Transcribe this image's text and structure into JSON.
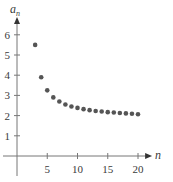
{
  "chart_data": {
    "type": "scatter",
    "title": "",
    "xlabel": "n",
    "ylabel": "a_n",
    "ylabel_display": "a",
    "ylabel_sub": "n",
    "x": [
      3,
      4,
      5,
      6,
      7,
      8,
      9,
      10,
      11,
      12,
      13,
      14,
      15,
      16,
      17,
      18,
      19,
      20
    ],
    "values": [
      5.5,
      3.9,
      3.25,
      2.9,
      2.7,
      2.55,
      2.45,
      2.38,
      2.32,
      2.27,
      2.23,
      2.2,
      2.17,
      2.15,
      2.13,
      2.11,
      2.09,
      2.07
    ],
    "xticks": [
      5,
      10,
      15,
      20
    ],
    "xtick_labels": [
      "5",
      "10",
      "15",
      "20"
    ],
    "yticks": [
      1,
      2,
      3,
      4,
      5,
      6
    ],
    "ytick_labels": [
      "1",
      "2",
      "3",
      "4",
      "5",
      "6"
    ],
    "xlim": [
      0,
      22
    ],
    "ylim": [
      0,
      7
    ],
    "grid": false,
    "legend": null,
    "colors": {
      "points": "#555555",
      "axes": "#777777"
    }
  }
}
